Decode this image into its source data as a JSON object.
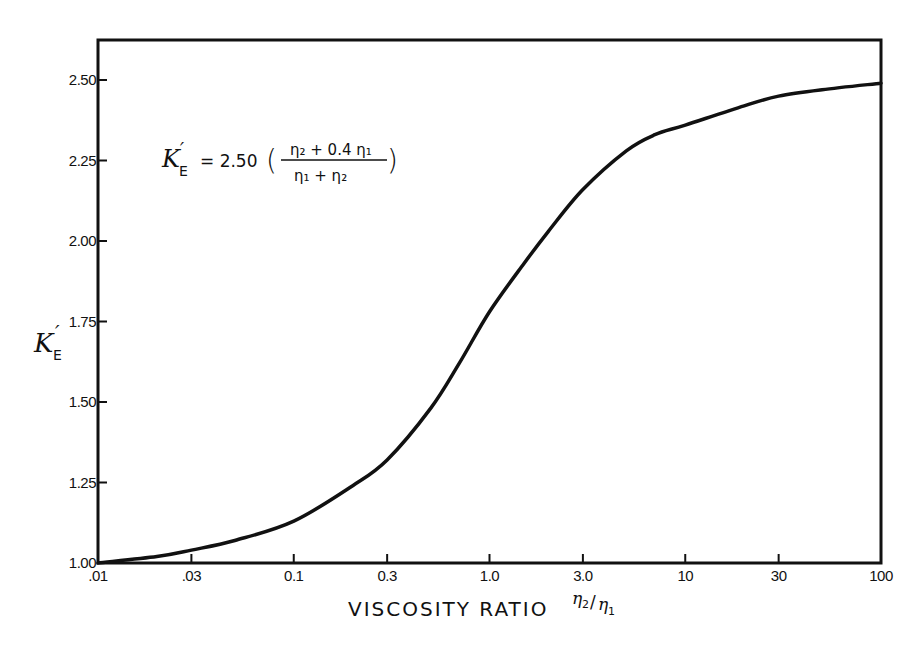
{
  "chart_data": {
    "type": "line",
    "title": "",
    "xlabel": "VISCOSITY RATIO η2/η1",
    "ylabel": "K'E",
    "x_scale": "log",
    "xlim": [
      0.01,
      100
    ],
    "ylim": [
      1.0,
      2.6
    ],
    "grid": false,
    "legend": null,
    "x_ticks": [
      ".01",
      ".03",
      "0.1",
      "0.3",
      "1.0",
      "3.0",
      "10",
      "30",
      "100"
    ],
    "y_ticks": [
      "1.00",
      "1.25",
      "1.50",
      "1.75",
      "2.00",
      "2.25",
      "2.50"
    ],
    "annotation": "K'E = 2.50 ((η2 + 0.4 η1) / (η1 + η2))",
    "series": [
      {
        "name": "K'E",
        "x": [
          0.01,
          0.02,
          0.03,
          0.05,
          0.1,
          0.2,
          0.3,
          0.5,
          0.7,
          1.0,
          1.5,
          2.0,
          3.0,
          5.0,
          7.0,
          10,
          20,
          30,
          50,
          100
        ],
        "y": [
          1.0,
          1.02,
          1.04,
          1.07,
          1.13,
          1.24,
          1.32,
          1.48,
          1.62,
          1.78,
          1.93,
          2.03,
          2.16,
          2.28,
          2.33,
          2.36,
          2.42,
          2.45,
          2.47,
          2.49
        ]
      }
    ]
  },
  "labels": {
    "x_axis_title": "VISCOSITY RATIO",
    "x_axis_ratio_num": "η",
    "x_axis_ratio_num_sub": "2",
    "x_axis_ratio_slash": "/",
    "x_axis_ratio_den": "η",
    "x_axis_ratio_den_sub": "1",
    "y_axis_symbol": "K",
    "y_axis_prime": "′",
    "y_axis_sub": "E",
    "eq_lhs": "K",
    "eq_prime": "′",
    "eq_sub": "E",
    "eq_coeff": "= 2.50",
    "eq_num": "η₂ + 0.4  η₁",
    "eq_den": "η₁  +  η₂",
    "eq_open": "(",
    "eq_close": ")"
  }
}
